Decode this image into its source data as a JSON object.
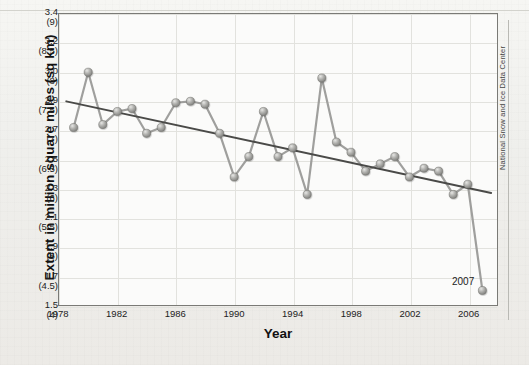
{
  "chart_data": {
    "type": "line",
    "title": "",
    "subtitle": "",
    "xlabel": "Year",
    "ylabel": "Extent in million square miles (sq km)",
    "xlim": [
      1978,
      2008
    ],
    "ylim": [
      1.5,
      3.4
    ],
    "grid": true,
    "legend_position": "none",
    "xtick_labels": [
      "1978",
      "1982",
      "1986",
      "1990",
      "1994",
      "1998",
      "2002",
      "2006"
    ],
    "xtick_values": [
      1978,
      1982,
      1986,
      1990,
      1994,
      1998,
      2002,
      2006
    ],
    "ytick_labels": [
      {
        "primary": "3.4",
        "secondary": "(9)"
      },
      {
        "primary": "3.2",
        "secondary": "(8.5)"
      },
      {
        "primary": "3.0",
        "secondary": "(8)"
      },
      {
        "primary": "2.9",
        "secondary": "(7.5)"
      },
      {
        "primary": "2.7",
        "secondary": "(7)"
      },
      {
        "primary": "2.5",
        "secondary": "(6.5)"
      },
      {
        "primary": "2.3",
        "secondary": "(6)"
      },
      {
        "primary": "2.1",
        "secondary": "(5.5)"
      },
      {
        "primary": "1.9",
        "secondary": "(5)"
      },
      {
        "primary": "1.7",
        "secondary": "(4.5)"
      },
      {
        "primary": "1.5",
        "secondary": "(4)"
      }
    ],
    "ytick_values": [
      3.4,
      3.2,
      3.0,
      2.9,
      2.7,
      2.5,
      2.3,
      2.1,
      1.9,
      1.7,
      1.5
    ],
    "series": [
      {
        "name": "Arctic sea ice minimum extent",
        "marker": "sphere",
        "color": "#9a9a98",
        "x": [
          1979,
          1980,
          1981,
          1982,
          1983,
          1984,
          1985,
          1986,
          1987,
          1988,
          1989,
          1990,
          1991,
          1992,
          1993,
          1994,
          1995,
          1996,
          1997,
          1998,
          1999,
          2000,
          2001,
          2002,
          2003,
          2004,
          2005,
          2006,
          2007
        ],
        "values": [
          2.72,
          3.0,
          2.74,
          2.83,
          2.85,
          2.68,
          2.72,
          2.89,
          2.9,
          2.88,
          2.68,
          2.38,
          2.52,
          2.83,
          2.52,
          2.58,
          2.26,
          2.98,
          2.62,
          2.55,
          2.42,
          2.47,
          2.52,
          2.38,
          2.44,
          2.42,
          2.26,
          2.33,
          1.6
        ]
      }
    ],
    "trendline": {
      "name": "linear trend",
      "color": "#4a4a48",
      "start": {
        "x": 1978.5,
        "y": 2.9
      },
      "end": {
        "x": 2007.6,
        "y": 2.27
      }
    },
    "annotations": [
      {
        "text": "2007",
        "x": 2006.2,
        "y": 1.72
      }
    ],
    "credit": "National Snow and Ice Data Center"
  }
}
